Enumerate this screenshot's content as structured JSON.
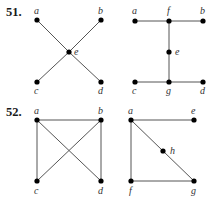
{
  "problems": [
    {
      "number": "51.",
      "number_pos": [
        6,
        16
      ],
      "graphs": [
        {
          "id": "51-left",
          "nodes": [
            {
              "id": "a",
              "x": 37,
              "y": 20,
              "lx": 34,
              "ly": 14
            },
            {
              "id": "b",
              "x": 101,
              "y": 20,
              "lx": 98,
              "ly": 14
            },
            {
              "id": "e",
              "x": 69,
              "y": 52,
              "lx": 74,
              "ly": 55
            },
            {
              "id": "c",
              "x": 37,
              "y": 82,
              "lx": 34,
              "ly": 94
            },
            {
              "id": "d",
              "x": 101,
              "y": 82,
              "lx": 98,
              "ly": 94
            }
          ],
          "edges": [
            [
              "a",
              "e"
            ],
            [
              "e",
              "d"
            ],
            [
              "b",
              "e"
            ],
            [
              "e",
              "c"
            ]
          ]
        },
        {
          "id": "51-right",
          "nodes": [
            {
              "id": "a",
              "x": 135,
              "y": 21,
              "lx": 132,
              "ly": 14
            },
            {
              "id": "f",
              "x": 169,
              "y": 21,
              "lx": 167,
              "ly": 14
            },
            {
              "id": "b",
              "x": 203,
              "y": 21,
              "lx": 200,
              "ly": 14
            },
            {
              "id": "e",
              "x": 169,
              "y": 52,
              "lx": 175,
              "ly": 55
            },
            {
              "id": "c",
              "x": 135,
              "y": 82,
              "lx": 132,
              "ly": 94
            },
            {
              "id": "g",
              "x": 169,
              "y": 82,
              "lx": 166,
              "ly": 94
            },
            {
              "id": "d",
              "x": 203,
              "y": 82,
              "lx": 200,
              "ly": 94
            }
          ],
          "edges": [
            [
              "a",
              "f"
            ],
            [
              "f",
              "b"
            ],
            [
              "f",
              "e"
            ],
            [
              "e",
              "g"
            ],
            [
              "c",
              "g"
            ],
            [
              "g",
              "d"
            ]
          ]
        }
      ]
    },
    {
      "number": "52.",
      "number_pos": [
        6,
        116
      ],
      "graphs": [
        {
          "id": "52-left",
          "nodes": [
            {
              "id": "a",
              "x": 37,
              "y": 120,
              "lx": 34,
              "ly": 114
            },
            {
              "id": "b",
              "x": 101,
              "y": 120,
              "lx": 98,
              "ly": 114
            },
            {
              "id": "c",
              "x": 37,
              "y": 181,
              "lx": 34,
              "ly": 194
            },
            {
              "id": "d",
              "x": 101,
              "y": 181,
              "lx": 98,
              "ly": 194
            }
          ],
          "edges": [
            [
              "a",
              "b"
            ],
            [
              "a",
              "c"
            ],
            [
              "b",
              "d"
            ],
            [
              "a",
              "d"
            ],
            [
              "b",
              "c"
            ]
          ]
        },
        {
          "id": "52-right",
          "nodes": [
            {
              "id": "a",
              "x": 131,
              "y": 120,
              "lx": 128,
              "ly": 114
            },
            {
              "id": "e",
              "x": 194,
              "y": 120,
              "lx": 191,
              "ly": 114
            },
            {
              "id": "h",
              "x": 163,
              "y": 151,
              "lx": 170,
              "ly": 154
            },
            {
              "id": "f",
              "x": 131,
              "y": 181,
              "lx": 129,
              "ly": 194
            },
            {
              "id": "g",
              "x": 194,
              "y": 181,
              "lx": 191,
              "ly": 194
            }
          ],
          "edges": [
            [
              "a",
              "e"
            ],
            [
              "a",
              "f"
            ],
            [
              "f",
              "g"
            ],
            [
              "a",
              "h"
            ],
            [
              "h",
              "g"
            ]
          ]
        }
      ]
    }
  ]
}
